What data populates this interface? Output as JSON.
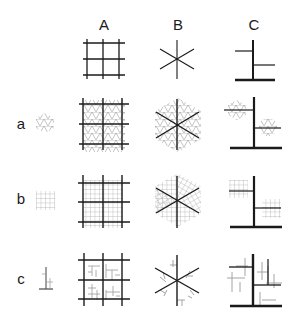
{
  "figure": {
    "column_headers": [
      "A",
      "B",
      "C"
    ],
    "row_labels": [
      "a",
      "b",
      "c"
    ],
    "column_patterns": [
      {
        "header": "A",
        "pattern": "square-grid"
      },
      {
        "header": "B",
        "pattern": "six-spoke-star"
      },
      {
        "header": "C",
        "pattern": "t-branch"
      }
    ],
    "row_motifs": [
      {
        "label": "a",
        "motif": "triangular-hex-lattice"
      },
      {
        "label": "b",
        "motif": "fine-square-grid"
      },
      {
        "label": "c",
        "motif": "small-branch"
      }
    ],
    "colors": {
      "primary_stroke": "#1a1a1a",
      "motif_stroke": "#9a9a9a",
      "background": "#ffffff"
    }
  }
}
